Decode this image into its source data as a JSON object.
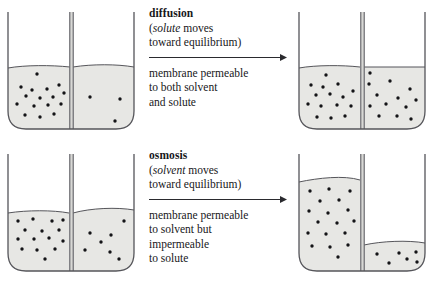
{
  "figure": {
    "colors": {
      "liquid_fill": "#e7e7e4",
      "air_fill": "#ffffff",
      "outline": "#55555a",
      "membrane_fill": "#d8d8d5",
      "dot": "#141417",
      "arrow": "#2a2a2e",
      "text": "#17171a",
      "background": "#ffffff"
    },
    "rows": [
      {
        "id": "diffusion",
        "caption": {
          "title": "diffusion",
          "paren_line_1_em": "solute",
          "paren_line_1_rest": " moves",
          "paren_line_1_open": "(",
          "paren_line_2": "toward equilibrium)",
          "arrow": "rightwards-arrow",
          "note_lines": [
            "membrane permeable",
            "to both solvent",
            "and solute"
          ]
        },
        "before": {
          "label": "before-diffusion-beaker",
          "left_compartment": {
            "level_percent": 52,
            "dot_count": 16,
            "description": "high solute concentration"
          },
          "right_compartment": {
            "level_percent": 53,
            "dot_count": 3,
            "description": "low solute concentration"
          }
        },
        "after": {
          "label": "after-diffusion-beaker",
          "left_compartment": {
            "level_percent": 52,
            "dot_count": 13,
            "description": "equal solute concentration"
          },
          "right_compartment": {
            "level_percent": 52,
            "dot_count": 13,
            "description": "equal solute concentration"
          }
        }
      },
      {
        "id": "osmosis",
        "caption": {
          "title": "osmosis",
          "paren_line_1_em": "solvent",
          "paren_line_1_rest": " moves",
          "paren_line_1_open": "(",
          "paren_line_2": "toward equilibrium)",
          "arrow": "rightwards-arrow",
          "note_lines": [
            "membrane permeable",
            "to solvent but",
            "impermeable",
            "to solute"
          ]
        },
        "before": {
          "label": "before-osmosis-beaker",
          "left_compartment": {
            "level_percent": 50,
            "dot_count": 15,
            "description": "high solute concentration"
          },
          "right_compartment": {
            "level_percent": 52,
            "dot_count": 7,
            "description": "low solute concentration"
          }
        },
        "after": {
          "label": "after-osmosis-beaker",
          "left_compartment": {
            "level_percent": 78,
            "dot_count": 18,
            "description": "solvent moved in, level risen"
          },
          "right_compartment": {
            "level_percent": 24,
            "dot_count": 6,
            "description": "solvent moved out, level fallen"
          }
        }
      }
    ]
  }
}
